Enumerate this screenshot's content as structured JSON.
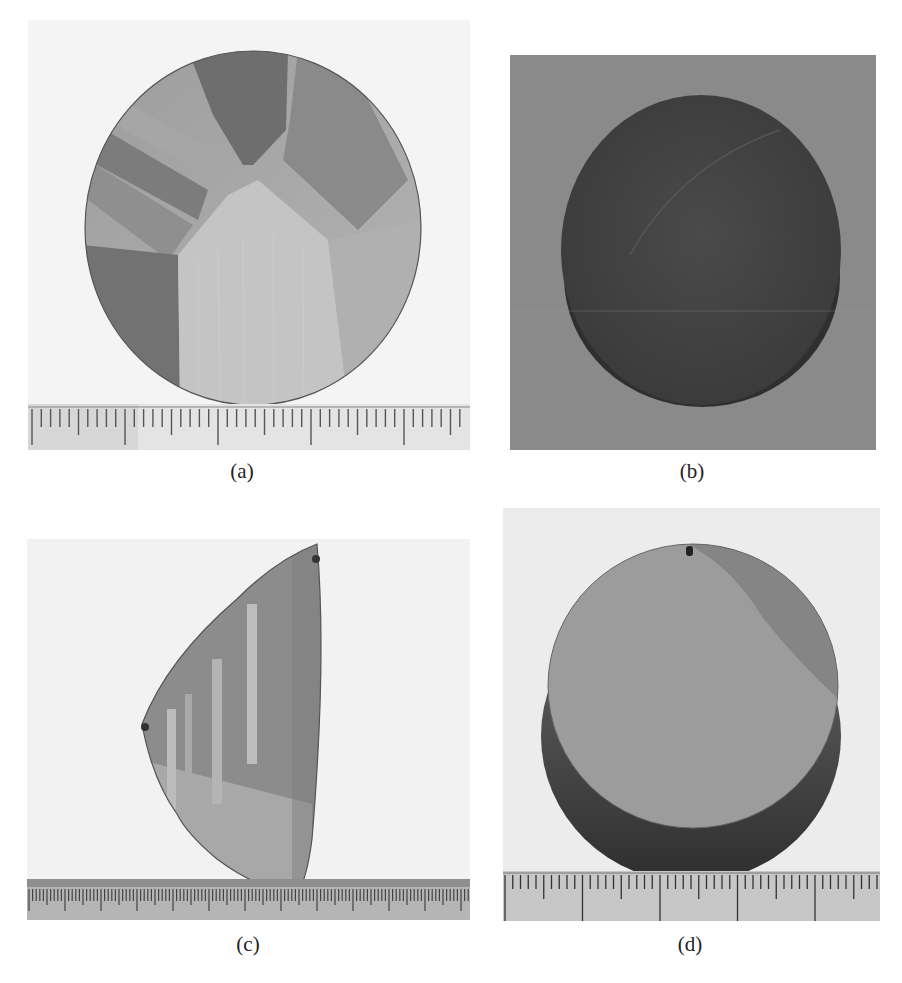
{
  "figure": {
    "panels": [
      {
        "id": "a",
        "caption": "(a)",
        "subject": "circular polished wafer with visible multi-grain crystal structure",
        "has_ruler": true,
        "ruler_style": "mm scale, major ticks every 5 mm",
        "background": "white paper"
      },
      {
        "id": "b",
        "caption": "(b)",
        "subject": "dark cylindrical ingot slice, unpolished surface",
        "has_ruler": false,
        "background": "gray"
      },
      {
        "id": "c",
        "caption": "(c)",
        "subject": "triangular / cone-shaped crystal fragment with twin lamellae stripes",
        "has_ruler": true,
        "ruler_style": "mm scale, long edge ruler",
        "background": "white paper"
      },
      {
        "id": "d",
        "caption": "(d)",
        "subject": "thick cylindrical crystal disk, largely single-grain polished face",
        "has_ruler": true,
        "ruler_style": "mm scale, major ticks every 10 mm",
        "background": "light gray"
      }
    ]
  }
}
